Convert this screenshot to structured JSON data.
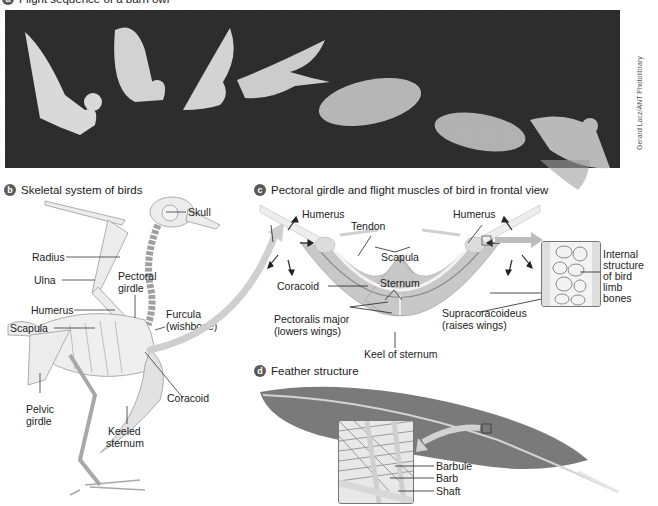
{
  "panel_a": {
    "badge": "a",
    "title_partial": "Flight sequence of a barn owl",
    "photo_credit": "Gerard Lacz/ANT Photolibrary",
    "owl_count": 7
  },
  "panel_b": {
    "badge": "b",
    "title": "Skeletal system of birds",
    "labels": {
      "skull": "Skull",
      "radius": "Radius",
      "ulna": "Ulna",
      "pectoral_girdle_1": "Pectoral",
      "pectoral_girdle_2": "girdle",
      "humerus": "Humerus",
      "furcula_1": "Furcula",
      "furcula_2": "(wishbone)",
      "scapula": "Scapula",
      "coracoid": "Coracoid",
      "pelvic_girdle_1": "Pelvic",
      "pelvic_girdle_2": "girdle",
      "keeled_sternum_1": "Keeled",
      "keeled_sternum_2": "sternum"
    }
  },
  "panel_c": {
    "badge": "c",
    "title": "Pectoral girdle and flight muscles of bird in frontal view",
    "labels": {
      "humerus_left": "Humerus",
      "humerus_right": "Humerus",
      "tendon": "Tendon",
      "scapula": "Scapula",
      "coracoid": "Coracoid",
      "sternum": "Sternum",
      "pectoralis_1": "Pectoralis major",
      "pectoralis_2": "(lowers wings)",
      "supracoracoideus_1": "Supracoracoideus",
      "supracoracoideus_2": "(raises wings)",
      "keel": "Keel of sternum",
      "internal_1": "Internal",
      "internal_2": "structure",
      "internal_3": "of bird",
      "internal_4": "limb",
      "internal_5": "bones"
    }
  },
  "panel_d": {
    "badge": "d",
    "title": "Feather structure",
    "labels": {
      "barbule": "Barbule",
      "barb": "Barb",
      "shaft": "Shaft"
    }
  },
  "colors": {
    "badge": "#5a5a5a",
    "photo_bg": "#2c2c2c",
    "bone": "#e6e6e6",
    "bone_stroke": "#9a9a9a",
    "muscle": "#bdbdbd",
    "feather": "#7a7a7a",
    "arrow": "#c8c8c8"
  }
}
